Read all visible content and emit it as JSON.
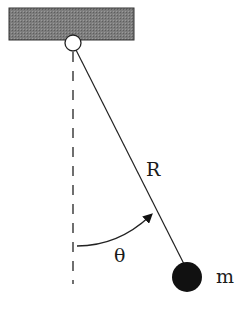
{
  "diagram": {
    "type": "simple pendulum",
    "labels": {
      "length": "R",
      "angle": "θ",
      "mass": "m"
    },
    "colors": {
      "ceiling_fill": "#7a7a7a",
      "line": "#222222",
      "bob": "#111111",
      "pivot_fill": "#ffffff"
    }
  }
}
